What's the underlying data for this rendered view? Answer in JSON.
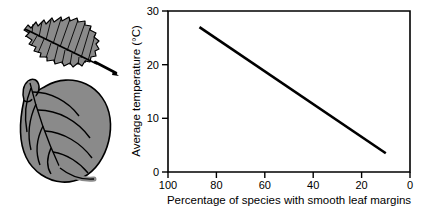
{
  "figure": {
    "caption_present": false,
    "background_color": "#ffffff"
  },
  "illustration": {
    "name": "leaf-margin-comparison",
    "leaves": [
      {
        "id": "toothed-leaf",
        "label": "toothed leaf",
        "margin_type": "toothed",
        "fill_color": "#8a8a8a",
        "outline_color": "#000000"
      },
      {
        "id": "smooth-leaf",
        "label": "smooth leaf",
        "margin_type": "smooth",
        "fill_color": "#8a8a8a",
        "outline_color": "#000000"
      }
    ]
  },
  "chart_data": {
    "type": "line",
    "title": "",
    "xlabel": "Percentage of species with smooth leaf margins",
    "ylabel": "Average temperature (°C)",
    "xlim": [
      100,
      0
    ],
    "ylim": [
      0,
      30
    ],
    "x_reversed": true,
    "grid": false,
    "legend": null,
    "xticks": [
      100,
      80,
      60,
      40,
      20,
      0
    ],
    "xticklabels": [
      "100",
      "80",
      "60",
      "40",
      "20",
      "0"
    ],
    "yticks": [
      0,
      10,
      20,
      30
    ],
    "yticklabels": [
      "0",
      "10",
      "20",
      "30"
    ],
    "series": [
      {
        "name": "temperature vs smooth-margin percentage",
        "color": "#000000",
        "linewidth": 2.6,
        "x": [
          87,
          10
        ],
        "y": [
          27.0,
          3.5
        ]
      }
    ]
  }
}
